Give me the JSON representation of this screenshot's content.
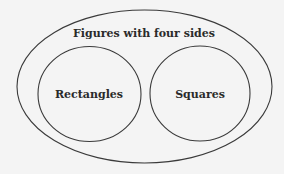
{
  "diagram": {
    "type": "venn",
    "outer": {
      "label": "Figures with four sides"
    },
    "inner": [
      {
        "label": "Rectangles"
      },
      {
        "label": "Squares"
      }
    ]
  },
  "colors": {
    "background": "#f4f4f4",
    "stroke": "#3a3a3a",
    "text": "#2a2a2a"
  }
}
